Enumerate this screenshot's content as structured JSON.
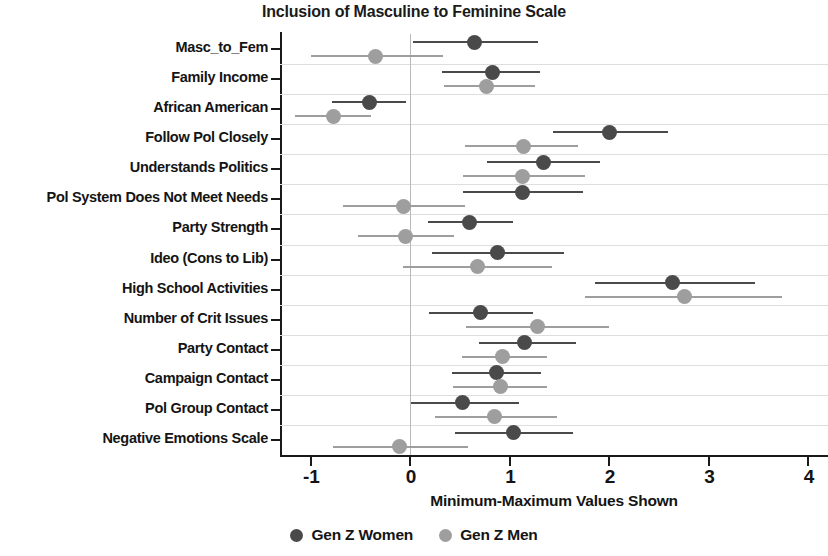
{
  "chart_data": {
    "type": "scatter",
    "title": "Inclusion of Masculine to Feminine Scale",
    "xlabel": "Minimum-Maximum Values Shown",
    "ylabel": "",
    "xlim": [
      -1.35,
      4.2
    ],
    "xticks": [
      -1,
      0,
      1,
      2,
      3,
      4
    ],
    "xticklabels": [
      "-1",
      "0",
      "1",
      "2",
      "3",
      "4"
    ],
    "grid": true,
    "grid_axis": "y",
    "legend_position": "bottom-center",
    "reference_line_x": 0,
    "categories": [
      "Masc_to_Fem",
      "Family Income",
      "African American",
      "Follow Pol Closely",
      "Understands Politics",
      "Pol System Does Not Meet Needs",
      "Party Strength",
      "Ideo (Cons to Lib)",
      "High School Activities",
      "Number of Crit Issues",
      "Party Contact",
      "Campaign Contact",
      "Pol Group Contact",
      "Negative Emotions Scale"
    ],
    "series": [
      {
        "name": "Gen Z Women",
        "color": "#4a4a4a",
        "values": [
          0.65,
          0.83,
          -0.41,
          2.0,
          1.34,
          1.13,
          0.6,
          0.88,
          2.64,
          0.71,
          1.15,
          0.87,
          0.53,
          1.04
        ],
        "ci_low": [
          0.03,
          0.32,
          -0.78,
          1.44,
          0.77,
          0.53,
          0.18,
          0.22,
          1.86,
          0.19,
          0.69,
          0.42,
          0.01,
          0.45
        ],
        "ci_high": [
          1.29,
          1.31,
          -0.04,
          2.59,
          1.91,
          1.74,
          1.04,
          1.55,
          3.47,
          1.24,
          1.67,
          1.32,
          1.1,
          1.64
        ]
      },
      {
        "name": "Gen Z Men",
        "color": "#9e9e9e",
        "values": [
          -0.35,
          0.77,
          -0.77,
          1.14,
          1.13,
          -0.07,
          -0.05,
          0.68,
          2.76,
          1.28,
          0.93,
          0.91,
          0.85,
          -0.11
        ],
        "ci_low": [
          -1.0,
          0.34,
          -1.16,
          0.55,
          0.53,
          -0.67,
          -0.52,
          -0.07,
          1.76,
          0.56,
          0.52,
          0.43,
          0.25,
          -0.77
        ],
        "ci_high": [
          0.33,
          1.26,
          -0.39,
          1.69,
          1.76,
          0.55,
          0.44,
          1.43,
          3.74,
          2.0,
          1.38,
          1.38,
          1.48,
          0.58
        ]
      }
    ]
  },
  "legend": {
    "items": [
      {
        "label": "Gen Z Women",
        "color": "#4a4a4a"
      },
      {
        "label": "Gen Z Men",
        "color": "#9e9e9e"
      }
    ]
  }
}
